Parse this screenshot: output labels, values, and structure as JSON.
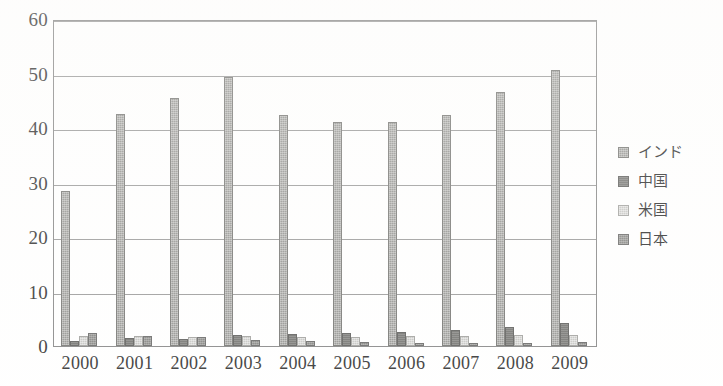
{
  "chart_data": {
    "type": "bar",
    "title": "",
    "subtitle": "",
    "xlabel": "",
    "ylabel": "",
    "categories": [
      "2000",
      "2001",
      "2002",
      "2003",
      "2004",
      "2005",
      "2006",
      "2007",
      "2008",
      "2009"
    ],
    "ylim": [
      0,
      60
    ],
    "yticks": [
      0,
      10,
      20,
      30,
      40,
      50,
      60
    ],
    "ytick_labels": [
      "0",
      "10",
      "20",
      "30",
      "40",
      "50",
      "60"
    ],
    "grid": true,
    "grid_axis": "y",
    "legend_position": "right",
    "series": [
      {
        "name": "インド",
        "color": "#8d8d8a",
        "values": [
          28.4,
          42.5,
          45.5,
          49.4,
          42.3,
          41.1,
          41.1,
          42.4,
          46.6,
          50.6
        ]
      },
      {
        "name": "中国",
        "color": "#6b6b68",
        "values": [
          1.0,
          1.5,
          1.2,
          2.1,
          2.2,
          2.3,
          2.5,
          2.9,
          3.4,
          4.2
        ]
      },
      {
        "name": "米国",
        "color": "#c2c2bf",
        "values": [
          1.9,
          1.9,
          1.6,
          1.8,
          1.6,
          1.7,
          1.8,
          1.9,
          2.0,
          2.0
        ]
      },
      {
        "name": "日本",
        "color": "#7c7c79",
        "values": [
          2.3,
          1.8,
          1.6,
          1.1,
          0.9,
          0.8,
          0.6,
          0.6,
          0.5,
          0.7
        ]
      }
    ]
  },
  "legend": {
    "items": [
      {
        "label": "インド",
        "swatch_class": "s0"
      },
      {
        "label": "中国",
        "swatch_class": "s1"
      },
      {
        "label": "米国",
        "swatch_class": "s2"
      },
      {
        "label": "日本",
        "swatch_class": "s3"
      }
    ]
  }
}
